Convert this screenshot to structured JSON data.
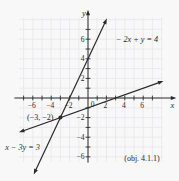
{
  "figure": {
    "background": "#f8f8f8",
    "ink_color": "#2b2b2b",
    "grid_color": "#e7e7ec"
  },
  "chart_data": {
    "type": "line",
    "title": "",
    "xlabel": "x",
    "ylabel": "y",
    "origin_label": "0",
    "grid": true,
    "xlim": [
      -8.0,
      9.6
    ],
    "ylim": [
      -6.6,
      9.0
    ],
    "grid_bounds": {
      "x": [
        -7.5,
        8.1
      ],
      "y": [
        -6.5,
        8.2
      ]
    },
    "tick_step": 1,
    "x_ticks": [
      -7,
      -6,
      -5,
      -4,
      -3,
      -2,
      -1,
      1,
      2,
      3,
      4,
      5,
      6,
      7
    ],
    "y_ticks": [
      -6,
      -5,
      -4,
      -3,
      -2,
      -1,
      1,
      2,
      3,
      4,
      5,
      6,
      7
    ],
    "x_tick_labels": [
      {
        "value": -6,
        "label": "−6"
      },
      {
        "value": -4,
        "label": "−4"
      },
      {
        "value": -2,
        "label": "−2"
      },
      {
        "value": 2,
        "label": "2"
      },
      {
        "value": 4,
        "label": "4"
      },
      {
        "value": 6,
        "label": "6"
      }
    ],
    "y_tick_labels": [
      {
        "value": 2,
        "label": "2"
      },
      {
        "value": 4,
        "label": "4"
      },
      {
        "value": 6,
        "label": "6"
      },
      {
        "value": -2,
        "label": "−2"
      },
      {
        "value": -4,
        "label": "−4"
      },
      {
        "value": -6,
        "label": "−6"
      }
    ],
    "series": [
      {
        "name": "line-neg2x-plus-y-eq-4",
        "label": "− 2x + y = 4",
        "slope": 2,
        "intercept": 4,
        "x_start": -5.9,
        "x_end": 2.05,
        "arrows": "both"
      },
      {
        "name": "line-x-minus-3y-eq-3",
        "label": "x − 3y = 3",
        "slope": 0.33333,
        "intercept": -1,
        "x_start": -7.5,
        "x_end": 8.2,
        "arrows": "both"
      }
    ],
    "points": [
      {
        "x": -3,
        "y": -2,
        "label": "(−3, −2)"
      }
    ],
    "annotation": "(obj. 4.1.1)",
    "legend": "none"
  }
}
